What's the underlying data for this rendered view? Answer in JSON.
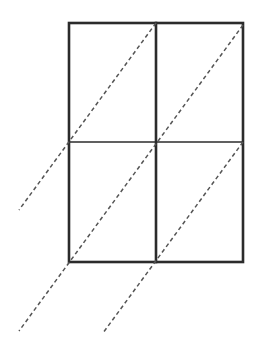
{
  "diagram": {
    "grid": {
      "columns": 2,
      "rows": 2
    },
    "colors": {
      "line": "#2b2b2b",
      "dashed": "#555555",
      "background": "#ffffff"
    },
    "dashed_lines": [
      {
        "id": "diagonal-1",
        "passes_through": [
          "top-middle",
          "middle-left"
        ]
      },
      {
        "id": "diagonal-2",
        "passes_through": [
          "top-right",
          "center",
          "bottom-left"
        ]
      },
      {
        "id": "diagonal-3",
        "passes_through": [
          "middle-right",
          "bottom-middle"
        ]
      }
    ]
  }
}
